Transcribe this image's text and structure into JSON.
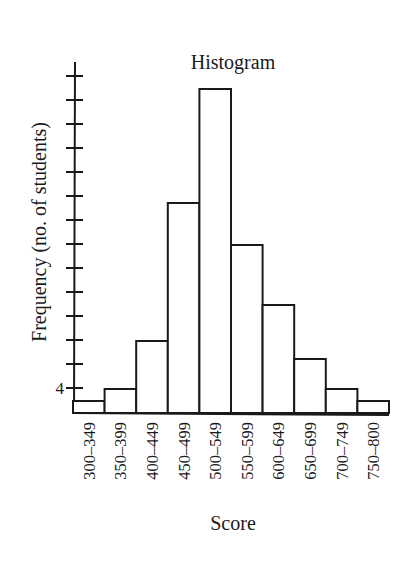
{
  "chart_data": {
    "type": "bar",
    "title": "Histogram",
    "xlabel": "Score",
    "ylabel": "Frequency (no. of students)",
    "categories": [
      "300–349",
      "350–399",
      "400–449",
      "450–499",
      "500–549",
      "550–599",
      "600–649",
      "650–699",
      "700–749",
      "750–800"
    ],
    "values": [
      2,
      4,
      12,
      35,
      54,
      28,
      18,
      9,
      4,
      2
    ],
    "ylim": [
      0,
      58
    ],
    "yticks": [
      4,
      8,
      12,
      16,
      20,
      24,
      28,
      32,
      36,
      40,
      44,
      48,
      52,
      56
    ],
    "ytick_labels_shown": [
      "4"
    ],
    "grid": false,
    "legend": null,
    "bar_gap": 0,
    "colors": {
      "bar_fill": "#ffffff",
      "bar_stroke": "#1a1a1a",
      "axis": "#1a1a1a",
      "text": "#1a1a1a"
    }
  }
}
